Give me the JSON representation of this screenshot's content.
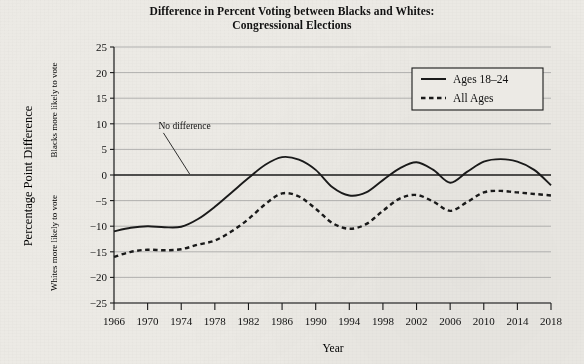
{
  "chart_data": {
    "type": "line",
    "title": "Difference in Percent Voting between Blacks and Whites:",
    "subtitle": "Congressional Elections",
    "xlabel": "Year",
    "ylabel": "Percentage Point Difference",
    "ylabel_upper": "Blacks more likely to vote",
    "ylabel_lower": "Whites more likely to vote",
    "grid": true,
    "legend_position": "top-right",
    "xlim": [
      1966,
      2018
    ],
    "ylim": [
      -25,
      25
    ],
    "ytick_labels": [
      "25",
      "20",
      "15",
      "10",
      "5",
      "0",
      "−5",
      "−10",
      "−15",
      "−20",
      "−25"
    ],
    "ytick_values": [
      25,
      20,
      15,
      10,
      5,
      0,
      -5,
      -10,
      -15,
      -20,
      -25
    ],
    "xtick_labels": [
      "1966",
      "1970",
      "1974",
      "1978",
      "1982",
      "1986",
      "1990",
      "1994",
      "1998",
      "2002",
      "2006",
      "2010",
      "2014",
      "2018"
    ],
    "xtick_values": [
      1966,
      1970,
      1974,
      1978,
      1982,
      1986,
      1990,
      1994,
      1998,
      2002,
      2006,
      2010,
      2014,
      2018
    ],
    "annotations": [
      {
        "text": "No difference",
        "x": 1972,
        "y": 9,
        "points_to_x": 1975,
        "points_to_y": 0
      }
    ],
    "zero_line": 0,
    "x": [
      1966,
      1968,
      1970,
      1972,
      1974,
      1976,
      1978,
      1980,
      1982,
      1984,
      1986,
      1988,
      1990,
      1992,
      1994,
      1996,
      1998,
      2000,
      2002,
      2004,
      2006,
      2008,
      2010,
      2012,
      2014,
      2016,
      2018
    ],
    "series": [
      {
        "name": "Ages 18–24",
        "style": "solid",
        "color": "#1a1a1a",
        "values": [
          -11.0,
          -10.3,
          -10.0,
          -10.2,
          -10.1,
          -8.6,
          -6.2,
          -3.4,
          -0.6,
          2.0,
          3.5,
          3.0,
          1.0,
          -2.4,
          -4.0,
          -3.4,
          -1.0,
          1.3,
          2.5,
          1.0,
          -1.5,
          0.6,
          2.6,
          3.1,
          2.6,
          1.0,
          -2.0
        ]
      },
      {
        "name": "All Ages",
        "style": "dashed",
        "color": "#1a1a1a",
        "values": [
          -16.0,
          -15.0,
          -14.6,
          -14.7,
          -14.5,
          -13.6,
          -12.8,
          -11.0,
          -8.6,
          -5.7,
          -3.6,
          -4.2,
          -6.6,
          -9.4,
          -10.5,
          -9.6,
          -7.0,
          -4.6,
          -3.9,
          -5.2,
          -7.0,
          -5.3,
          -3.4,
          -3.1,
          -3.4,
          -3.7,
          -4.0
        ]
      }
    ],
    "legend": [
      {
        "label": "Ages 18–24",
        "style": "solid"
      },
      {
        "label": "All Ages",
        "style": "dashed"
      }
    ]
  }
}
